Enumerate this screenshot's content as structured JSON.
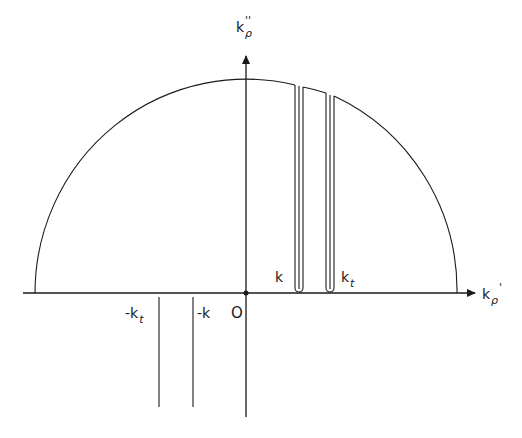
{
  "figure": {
    "type": "complex-plane-diagram",
    "axes": {
      "horizontal": {
        "symbol": "k",
        "subscript": "ρ",
        "superscript": "'"
      },
      "vertical": {
        "symbol": "k",
        "subscript": "ρ",
        "superscript": "''"
      }
    },
    "origin_label": "O",
    "positive_points": [
      {
        "symbol": "k",
        "subscript": ""
      },
      {
        "symbol": "k",
        "subscript": "t"
      }
    ],
    "negative_points": [
      {
        "symbol": "-k",
        "subscript": ""
      },
      {
        "symbol": "-k",
        "subscript": "t"
      }
    ],
    "contour": "semicircle in upper half-plane with branch-cut indentations above k and k_t",
    "colors": {
      "line": "#1a1a1a",
      "background": "#ffffff"
    }
  }
}
